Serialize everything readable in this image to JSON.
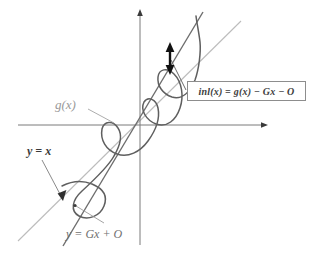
{
  "figure": {
    "background_color": "#ffffff",
    "width": 311,
    "height": 256
  },
  "colors": {
    "axis": "#7b7b7b",
    "curve_g": "#5a5a5a",
    "line_secant": "#6a6a6a",
    "line_identity": "#b9b9b9",
    "leader": "#8a8a8a",
    "arrow_black": "#111111",
    "box_border": "#8d8d8d",
    "label_gray": "#9a9a9a",
    "label_dark": "#3a3a3a"
  },
  "axes": {
    "x_axis": {
      "name": "horizontal-axis",
      "y": 125,
      "x_start": 18,
      "x_end": 268,
      "arrow_at": "right"
    },
    "y_axis": {
      "name": "vertical-axis",
      "x": 140,
      "y_start": 245,
      "y_end": 10,
      "arrow_at": "top"
    },
    "origin": [
      140,
      125
    ]
  },
  "labels": {
    "g_of_x": "g(x)",
    "y_equals_x": "y = x",
    "y_equals_gx_plus_o": "y = Gx + O",
    "inl_equation": "inl(x) = g(x) − Gx − O"
  },
  "annotations": {
    "gap_arrow": {
      "name": "double-headed-gap-arrow",
      "description": "vertical double-headed arrow measuring vertical gap between g(x) and the line y = Gx + O",
      "x": 170,
      "y_top": 45,
      "y_bottom": 72
    },
    "leader_inl": {
      "from": [
        186,
        90
      ],
      "to": [
        171,
        60
      ]
    },
    "leader_gx": {
      "from": [
        88,
        108
      ],
      "to": [
        113,
        122
      ]
    },
    "leader_yx": {
      "from": [
        42,
        160
      ],
      "to": [
        62,
        198
      ]
    },
    "leader_ygxo": {
      "from": [
        103,
        222
      ],
      "to": [
        74,
        205
      ]
    }
  },
  "curves": {
    "identity_line": {
      "name": "line-y-equals-x",
      "style": "light gray thin",
      "from": [
        18,
        241
      ],
      "to": [
        241,
        21
      ]
    },
    "secant_line": {
      "name": "line-y-equals-Gx-plus-O",
      "style": "dark gray, steeper slope",
      "from": [
        63,
        245
      ],
      "to": [
        202,
        13
      ]
    },
    "g_curve": {
      "name": "curve-g-of-x",
      "style": "dark gray oscillating about the secant line",
      "oscillations": 4
    }
  }
}
